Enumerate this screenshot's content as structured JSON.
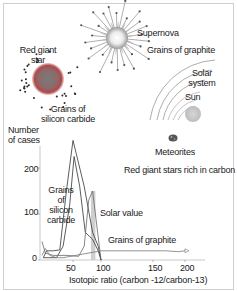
{
  "illustration": {
    "labels": {
      "red_giant": "Red giant\nstar",
      "red_giant_line1": "Red giant",
      "red_giant_line2": "star",
      "supernova": "Supernova",
      "grains_graphite_top": "Grains of graphite",
      "solar_system_line1": "Solar",
      "solar_system_line2": "system",
      "sun": "Sun",
      "grains_sic_line1": "Grains of",
      "grains_sic_line2": "silicon carbide",
      "meteorites": "Meteorites",
      "red_giant_rich": "Red giant stars rich in carbon"
    },
    "colors": {
      "red_giant_core": "#8a8a8a",
      "red_giant_halo": "#b33a3a",
      "supernova_core": "#ffffff",
      "sun": "#cfcfcf",
      "lines": "#555555"
    }
  },
  "chart_data": {
    "type": "line",
    "ylabel": "Number\nof cases",
    "ylabel_line1": "Number",
    "ylabel_line2": "of cases",
    "xlabel": "Isotopic ratio (carbon -12/carbon-13)",
    "xlim": [
      0,
      220
    ],
    "ylim": [
      0,
      260
    ],
    "x_ticks": [
      50,
      100,
      150,
      200
    ],
    "y_ticks": [
      0,
      100,
      200
    ],
    "x_tick_labels": [
      "50",
      "100",
      "150",
      "200"
    ],
    "y_tick_labels": [
      "0",
      "100",
      "200"
    ],
    "annotations": {
      "sic_line1": "Grains",
      "sic_line2": "of",
      "sic_line3": "silicon",
      "sic_line4": "carbide",
      "solar_value": "Solar value",
      "grains_graphite": "Grains of graphite"
    },
    "solar_value_band": [
      82,
      90
    ],
    "series": [
      {
        "name": "Grains of silicon carbide (peak A)",
        "x": [
          5,
          10,
          20,
          30,
          40,
          50,
          60,
          70,
          85,
          95,
          100
        ],
        "y": [
          5,
          20,
          20,
          22,
          150,
          260,
          210,
          160,
          60,
          30,
          0
        ]
      },
      {
        "name": "Grains of silicon carbide (peak B)",
        "x": [
          5,
          15,
          25,
          35,
          45,
          52,
          62,
          72,
          85,
          95,
          100
        ],
        "y": [
          5,
          5,
          5,
          30,
          120,
          225,
          160,
          60,
          45,
          20,
          0
        ]
      },
      {
        "name": "Red giant stars rich in carbon",
        "x": [
          3,
          8,
          20,
          40,
          60,
          70,
          78,
          85,
          95,
          100
        ],
        "y": [
          40,
          15,
          10,
          10,
          8,
          30,
          130,
          150,
          50,
          0
        ]
      },
      {
        "name": "Grains of graphite",
        "x": [
          3,
          8,
          15,
          25,
          35,
          100,
          150,
          170,
          190,
          200
        ],
        "y": [
          10,
          25,
          10,
          5,
          5,
          20,
          20,
          20,
          18,
          20
        ]
      }
    ]
  }
}
